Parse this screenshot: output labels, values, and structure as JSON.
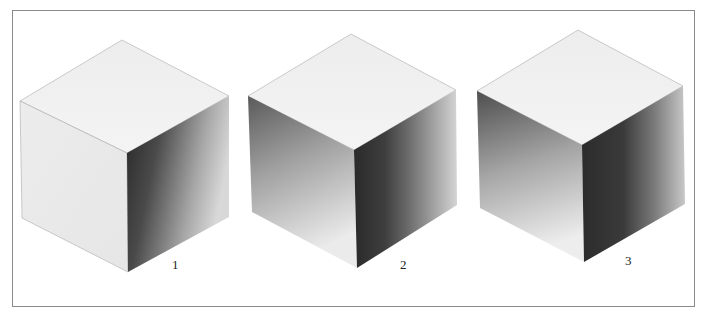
{
  "figure": {
    "cubes": [
      {
        "label": "1",
        "description": "cube with dark shading on right face only"
      },
      {
        "label": "2",
        "description": "cube with shading on left and right faces"
      },
      {
        "label": "3",
        "description": "cube with shading on left and right faces, darker vertical band"
      }
    ]
  },
  "colors": {
    "frame": "#8a8a8a",
    "face_light": "#f2f2f2",
    "face_dark": "#3a3a3a",
    "edge": "#9a9a9a"
  }
}
